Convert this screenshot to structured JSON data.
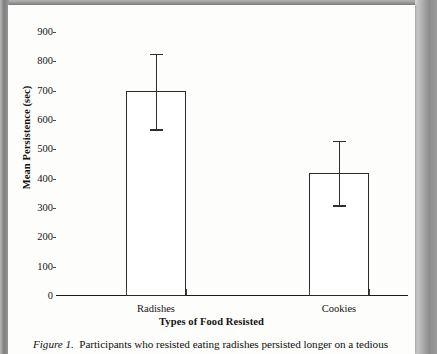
{
  "figure": {
    "caption_label": "Figure 1.",
    "caption_text": "Participants who resisted eating radishes persisted longer on a tedious"
  },
  "chart_data": {
    "type": "bar",
    "title": "",
    "subtitle": "",
    "categories": [
      "Radishes",
      "Cookies"
    ],
    "values": [
      700,
      420
    ],
    "error_low": [
      568,
      309
    ],
    "error_high": [
      826,
      530
    ],
    "xlabel": "Types of Food Resisted",
    "ylabel": "Mean Persistence (sec)",
    "ylim": [
      0,
      900
    ],
    "ytick_values": [
      0,
      100,
      200,
      300,
      400,
      500,
      600,
      700,
      800,
      900
    ],
    "ytick_labels": [
      "0",
      "100",
      "200",
      "300",
      "400",
      "500",
      "600",
      "700",
      "800",
      "900"
    ],
    "grid": false,
    "legend": "none",
    "bar_fill_color": "#ffffff",
    "bar_edge_color": "#2a2a2a",
    "error_color": "#2f2f2f",
    "axis_color": "#1b1b1b"
  }
}
